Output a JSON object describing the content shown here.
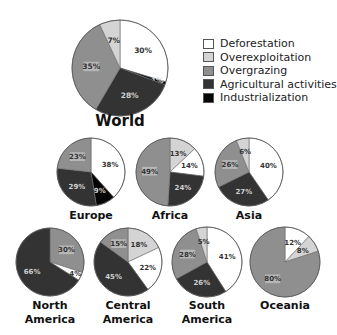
{
  "chart_data": {
    "type": "pie",
    "title": "",
    "legend": {
      "position": "right-top",
      "entries": [
        {
          "name": "Deforestation",
          "color": "#ffffff"
        },
        {
          "name": "Overexploitation",
          "color": "#d4d4d4"
        },
        {
          "name": "Overgrazing",
          "color": "#8f8f8f"
        },
        {
          "name": "Agricultural activities",
          "color": "#333333"
        },
        {
          "name": "Industrialization",
          "color": "#050505"
        }
      ]
    },
    "categories": [
      "Deforestation",
      "Overexploitation",
      "Overgrazing",
      "Agricultural activities",
      "Industrialization"
    ],
    "pies": [
      {
        "name": "World",
        "label_lines": [
          "World"
        ],
        "cx": 120,
        "cy": 68,
        "r": 48,
        "label_y": 126,
        "label_size": 15,
        "slices": [
          {
            "cat": 0,
            "value": 30,
            "label": "30%"
          },
          {
            "cat": 4,
            "value": 1,
            "label": "1%"
          },
          {
            "cat": 3,
            "value": 28,
            "label": "28%"
          },
          {
            "cat": 2,
            "value": 35,
            "label": "35%"
          },
          {
            "cat": 1,
            "value": 7,
            "label": "7%"
          }
        ]
      },
      {
        "name": "Europe",
        "label_lines": [
          "Europe"
        ],
        "cx": 91,
        "cy": 172,
        "r": 34,
        "label_y": 219,
        "label_size": 11,
        "slices": [
          {
            "cat": 0,
            "value": 38,
            "label": "38%"
          },
          {
            "cat": 4,
            "value": 9,
            "label": "9%"
          },
          {
            "cat": 3,
            "value": 29,
            "label": "29%"
          },
          {
            "cat": 2,
            "value": 23,
            "label": "23%"
          }
        ]
      },
      {
        "name": "Africa",
        "label_lines": [
          "Africa"
        ],
        "cx": 170,
        "cy": 172,
        "r": 34,
        "label_y": 219,
        "label_size": 11,
        "slices": [
          {
            "cat": 1,
            "value": 13,
            "label": "13%"
          },
          {
            "cat": 0,
            "value": 14,
            "label": "14%"
          },
          {
            "cat": 3,
            "value": 24,
            "label": "24%"
          },
          {
            "cat": 2,
            "value": 49,
            "label": "49%"
          }
        ]
      },
      {
        "name": "Asia",
        "label_lines": [
          "Asia"
        ],
        "cx": 249,
        "cy": 172,
        "r": 34,
        "label_y": 219,
        "label_size": 11,
        "slices": [
          {
            "cat": 0,
            "value": 40,
            "label": "40%"
          },
          {
            "cat": 3,
            "value": 27,
            "label": "27%"
          },
          {
            "cat": 2,
            "value": 26,
            "label": "26%"
          },
          {
            "cat": 1,
            "value": 6,
            "label": "6%"
          }
        ]
      },
      {
        "name": "North America",
        "label_lines": [
          "North",
          "America"
        ],
        "cx": 50,
        "cy": 262,
        "r": 34,
        "label_y": 309,
        "label_size": 11,
        "slices": [
          {
            "cat": 2,
            "value": 30,
            "label": "30%"
          },
          {
            "cat": 0,
            "value": 4,
            "label": "4%"
          },
          {
            "cat": 3,
            "value": 66,
            "label": "66%"
          }
        ]
      },
      {
        "name": "Central America",
        "label_lines": [
          "Central",
          "America"
        ],
        "cx": 128,
        "cy": 262,
        "r": 34,
        "label_y": 309,
        "label_size": 11,
        "slices": [
          {
            "cat": 1,
            "value": 18,
            "label": "18%"
          },
          {
            "cat": 0,
            "value": 22,
            "label": "22%"
          },
          {
            "cat": 3,
            "value": 45,
            "label": "45%"
          },
          {
            "cat": 2,
            "value": 15,
            "label": "15%"
          }
        ]
      },
      {
        "name": "South America",
        "label_lines": [
          "South",
          "America"
        ],
        "cx": 207,
        "cy": 262,
        "r": 35,
        "label_y": 309,
        "label_size": 11,
        "slices": [
          {
            "cat": 0,
            "value": 41,
            "label": "41%"
          },
          {
            "cat": 3,
            "value": 26,
            "label": "26%"
          },
          {
            "cat": 2,
            "value": 28,
            "label": "28%"
          },
          {
            "cat": 1,
            "value": 5,
            "label": "5%"
          }
        ]
      },
      {
        "name": "Oceania",
        "label_lines": [
          "Oceania"
        ],
        "cx": 285,
        "cy": 262,
        "r": 35,
        "label_y": 309,
        "label_size": 11,
        "slices": [
          {
            "cat": 0,
            "value": 12,
            "label": "12%"
          },
          {
            "cat": 1,
            "value": 8,
            "label": "8%"
          },
          {
            "cat": 2,
            "value": 80,
            "label": "80%"
          }
        ]
      }
    ]
  }
}
